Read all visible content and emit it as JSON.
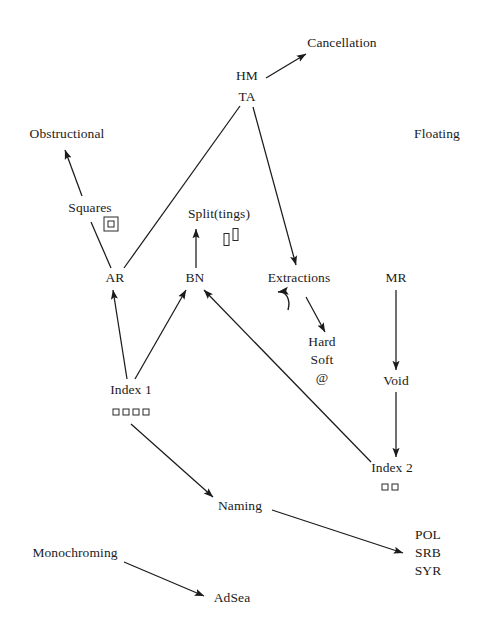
{
  "diagram": {
    "background_color": "#ffffff",
    "ink_color": "#1b1b1b",
    "nodes": [
      {
        "id": "cancellation",
        "label": "Cancellation",
        "x": 342,
        "y": 43
      },
      {
        "id": "hm",
        "label": "HM",
        "x": 247,
        "y": 76
      },
      {
        "id": "ta",
        "label": "TA",
        "x": 247,
        "y": 97
      },
      {
        "id": "obstructional",
        "label": "Obstructional",
        "x": 67,
        "y": 134
      },
      {
        "id": "floating",
        "label": "Floating",
        "x": 437,
        "y": 134
      },
      {
        "id": "squares",
        "label": "Squares",
        "x": 90,
        "y": 208
      },
      {
        "id": "splittings",
        "label": "Split(tings)",
        "x": 219,
        "y": 214
      },
      {
        "id": "ar",
        "label": "AR",
        "x": 115,
        "y": 278
      },
      {
        "id": "bn",
        "label": "BN",
        "x": 195,
        "y": 278
      },
      {
        "id": "extractions",
        "label": "Extractions",
        "x": 299,
        "y": 278
      },
      {
        "id": "mr",
        "label": "MR",
        "x": 396,
        "y": 278
      },
      {
        "id": "hardsoft",
        "label": "Hard\nSoft\n@",
        "x": 322,
        "y": 360
      },
      {
        "id": "void",
        "label": "Void",
        "x": 396,
        "y": 381
      },
      {
        "id": "index1",
        "label": "Index 1",
        "x": 131,
        "y": 390
      },
      {
        "id": "index2",
        "label": "Index 2",
        "x": 392,
        "y": 468
      },
      {
        "id": "naming",
        "label": "Naming",
        "x": 240,
        "y": 506
      },
      {
        "id": "monochroming",
        "label": "Monochroming",
        "x": 75,
        "y": 553
      },
      {
        "id": "adsea",
        "label": "AdSea",
        "x": 232,
        "y": 598
      },
      {
        "id": "codes",
        "label": "POL\nSRB\nSYR",
        "x": 428,
        "y": 553
      }
    ],
    "glyph_groups": [
      {
        "id": "squares-glyph",
        "near": "squares",
        "kind": "nested-square",
        "count": 1,
        "x": 111,
        "y": 224
      },
      {
        "id": "splittings-glyph",
        "near": "splittings",
        "kind": "bars",
        "count": 2,
        "x": 231,
        "y": 237
      },
      {
        "id": "index1-glyph",
        "near": "index1",
        "kind": "squares",
        "count": 4,
        "x": 131,
        "y": 412
      },
      {
        "id": "index2-glyph",
        "near": "index2",
        "kind": "squares",
        "count": 2,
        "x": 390,
        "y": 487
      }
    ],
    "edges": [
      {
        "id": "hm-cancellation",
        "from": "HM",
        "to": "Cancellation",
        "arrow": true,
        "style": "straight"
      },
      {
        "id": "squares-obstructional",
        "from": "Squares",
        "to": "Obstructional",
        "arrow": true,
        "style": "straight"
      },
      {
        "id": "squares-ar",
        "from": "Squares",
        "to": "AR",
        "arrow": false,
        "style": "straight"
      },
      {
        "id": "ar-ta",
        "from": "AR",
        "to": "TA",
        "arrow": false,
        "style": "straight"
      },
      {
        "id": "ta-extractions",
        "from": "TA",
        "to": "Extractions",
        "arrow": true,
        "style": "straight"
      },
      {
        "id": "bn-splittings",
        "from": "BN",
        "to": "Split(tings)",
        "arrow": true,
        "style": "straight"
      },
      {
        "id": "extractions-self",
        "from": "Extractions",
        "to": "Extractions",
        "arrow": true,
        "style": "curved-hook"
      },
      {
        "id": "extractions-hardsoft",
        "from": "Extractions",
        "to": "Hard Soft @",
        "arrow": true,
        "style": "straight"
      },
      {
        "id": "mr-void",
        "from": "MR",
        "to": "Void",
        "arrow": true,
        "style": "straight"
      },
      {
        "id": "void-index2",
        "from": "Void",
        "to": "Index 2",
        "arrow": true,
        "style": "straight"
      },
      {
        "id": "index1-ar",
        "from": "Index 1",
        "to": "AR",
        "arrow": true,
        "style": "straight"
      },
      {
        "id": "index1-bn",
        "from": "Index 1",
        "to": "BN",
        "arrow": true,
        "style": "straight"
      },
      {
        "id": "index2-bn",
        "from": "Index 2",
        "to": "BN",
        "arrow": true,
        "style": "straight"
      },
      {
        "id": "index1-naming",
        "from": "Index 1",
        "to": "Naming",
        "arrow": true,
        "style": "straight"
      },
      {
        "id": "naming-codes",
        "from": "Naming",
        "to": "POL SRB SYR",
        "arrow": true,
        "style": "straight"
      },
      {
        "id": "monochroming-adsea",
        "from": "Monochroming",
        "to": "AdSea",
        "arrow": true,
        "style": "straight"
      }
    ]
  }
}
